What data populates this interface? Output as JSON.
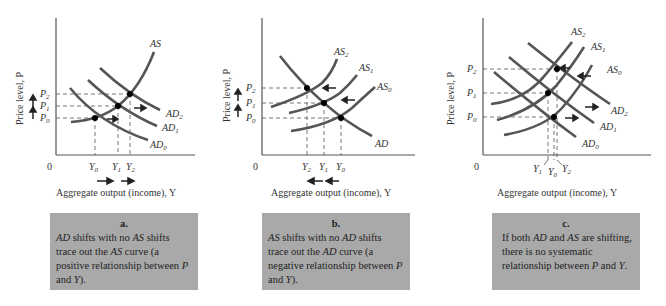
{
  "common": {
    "ylabel": "Price level, P",
    "xlabel": "Aggregate output (income), Y",
    "origin": "0"
  },
  "panels": [
    {
      "id": "a",
      "curves": [
        "AS",
        "AD2",
        "AD1",
        "AD0"
      ],
      "price_labels": [
        "P2",
        "P1",
        "P0"
      ],
      "output_labels": [
        "Y0",
        "Y1",
        "Y2"
      ],
      "caption": {
        "letter": "a.",
        "text": "AD shifts with no AS shifts trace out the AS curve (a positive relationship between P and Y)."
      }
    },
    {
      "id": "b",
      "curves": [
        "AS2",
        "AS1",
        "AS0",
        "AD"
      ],
      "price_labels": [
        "P2",
        "P1",
        "P0"
      ],
      "output_labels": [
        "Y2",
        "Y1",
        "Y0"
      ],
      "caption": {
        "letter": "b.",
        "text": "AS shifts with no AD shifts trace out the AD curve (a negative relationship between P and Y)."
      }
    },
    {
      "id": "c",
      "curves": [
        "AS2",
        "AS1",
        "AS0",
        "AD2",
        "AD1",
        "AD0"
      ],
      "price_labels": [
        "P2",
        "P1",
        "P0"
      ],
      "output_labels": [
        "Y1",
        "Y0",
        "Y2"
      ],
      "caption": {
        "letter": "c.",
        "text": "If both AD and AS are shifting, there is no systematic relationship between P and Y."
      }
    }
  ],
  "colors": {
    "curve": "#555555",
    "axis": "#555555",
    "dash": "#555555",
    "point": "#000000",
    "caption_bg": "#a9a9a9"
  }
}
